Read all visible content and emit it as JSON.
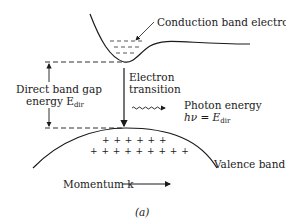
{
  "figure": {
    "panel_label": "(a)",
    "labels": {
      "conduction_band": "Conduction band electrons",
      "electron_transition_line1": "Electron",
      "electron_transition_line2": "transition",
      "photon_energy_line1": "Photon energy",
      "photon_energy_formula_lhs": "hν = E",
      "photon_energy_formula_sub": "dir",
      "band_gap_line1": "Direct band gap",
      "band_gap_line2_prefix": "energy E",
      "band_gap_sub": "dir",
      "valence_band": "Valence band",
      "momentum": "Momentum k"
    },
    "valence_plus_row1": "+ + + + + +",
    "valence_plus_row2": "+ + + + + + + + +",
    "colors": {
      "ink": "#1a1a1a",
      "background": "#ffffff"
    }
  }
}
